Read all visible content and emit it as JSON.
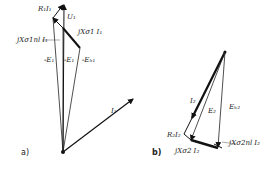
{
  "diagram": {
    "type": "phasor-diagram",
    "panels": [
      {
        "id": "a",
        "caption": "a)",
        "labels": {
          "r1i1": "R₁I₁",
          "u1": "U₁",
          "jx_s1nl_i1": "jXσ1nl I₁",
          "jx_s1_i1": "jXσ1 I₁",
          "minus_e1_a": "-E₁",
          "minus_e1_b": "-E₁",
          "minus_eh1": "-Eₕ₁",
          "i1": "I₁"
        }
      },
      {
        "id": "b",
        "caption": "b)",
        "labels": {
          "i2": "I₂",
          "e2": "E₂",
          "eh2": "Eₕ₂",
          "r2i2": "R₂I₂",
          "jx_s2_i2": "jXσ2 I₂",
          "jx_s2nl_i2": "jXσ2nl I₂"
        }
      }
    ]
  }
}
